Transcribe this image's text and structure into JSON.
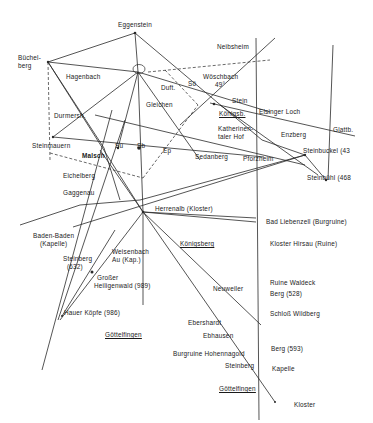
{
  "labels": {
    "eggenstein": "Eggenstein",
    "buechelberg_1": "Büchel-",
    "buechelberg_2": "berg",
    "hagenbach": "Hagenbach",
    "neibsheim": "Neibsheim",
    "woeschbach_1": "Wöschbach",
    "woeschbach_2": "49°",
    "duft": "Duft.",
    "so": "Sö",
    "gleichen": "Gleichen",
    "durmersh": "Durmersh.",
    "stein": "Stein",
    "koenigsb": "Königsb.",
    "elsinger_loch": "Elsinger Loch",
    "glattb": "Glattb.",
    "katherinentaler_1": "Katherinen-",
    "katherinentaler_2": "taler Hof",
    "enzberg": "Enzberg",
    "steinbuckel": "Steinbuckel (43",
    "steinmauern": "Steinmauern",
    "malsch": "Malsch",
    "su": "Su",
    "sb": "Sb",
    "ep": "Ep",
    "sedanberg": "Sedanberg",
    "pforzheim": "Pforzheim",
    "steinbuehl": "Steinbühl (468",
    "eichelberg": "Eichelberg",
    "gaggenau": "Gaggenau",
    "herrenalb": "Herrenalb (Kloster)",
    "bad_liebenzell": "Bad Liebenzell (Burgruine)",
    "baden_baden_1": "Baden-Baden",
    "baden_baden_2": "(Kapelle)",
    "koenigsberg": "Königsberg",
    "kloster_hirsau": "Kloster Hirsau (Ruine)",
    "steinberg_1": "Steinberg",
    "steinberg_2": "(632)",
    "weisenbach_1": "Weisenbach",
    "weisenbach_2": "Au (Kap.)",
    "grosser_1": "Großer",
    "grosser_2": "Heiligenwald (989)",
    "neuweiler": "Neuweiler",
    "ruine_waldeck": "Ruine Waldeck",
    "berg_528": "Berg (528)",
    "hauer_koepfe": "Hauer Köpfe (986)",
    "schloss_wildberg": "Schloß Wildberg",
    "ebershardt": "Ebershardt",
    "ebhausen": "Ebhausen",
    "goettelfingen_1": "Göttelfingen",
    "berg_593": "Berg (593)",
    "burgruine_hohennagold": "Burgruine Hohennagold",
    "steinberg_small": "Steinberg",
    "kapelle": "Kapelle",
    "goettelfingen_2": "Göttelfingen",
    "kloster": "Kloster"
  },
  "colors": {
    "line": "#2a2a2a",
    "background": "#ffffff"
  }
}
